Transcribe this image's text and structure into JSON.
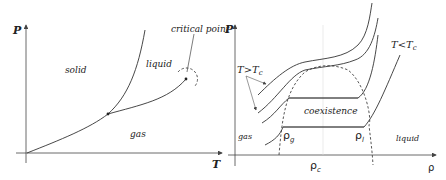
{
  "left_diagram": {
    "title": "P-T phase diagram",
    "axis_y_label": "P",
    "axis_x_label": "T",
    "regions": {
      "solid": "solid",
      "liquid": "liquid",
      "gas": "gas"
    },
    "annotation": "critical point"
  },
  "right_diagram": {
    "title": "P-rho isotherms",
    "axis_y_label": "P",
    "axis_x_label": "ρ",
    "label_high_T": "T>T",
    "label_high_T_sub": "c",
    "label_low_T": "T<T",
    "label_low_T_sub": "c",
    "coexistence": "coexistence",
    "gas": "gas",
    "liquid": "liquid",
    "rho_g": "ρ",
    "rho_g_sub": "g",
    "rho_l": "ρ",
    "rho_l_sub": "l",
    "rho_c": "ρ",
    "rho_c_sub": "c"
  }
}
